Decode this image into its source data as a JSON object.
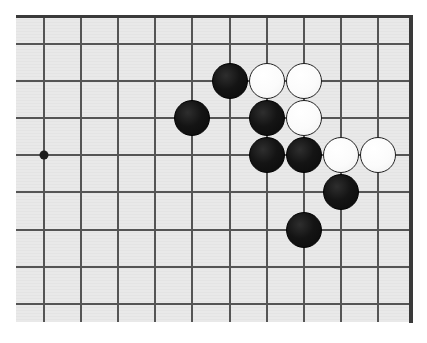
{
  "figure": {
    "kind": "go-board-diagram",
    "board_colors": {
      "surface": "#e9e9e9",
      "grid_line": "#555555",
      "border": "#3a3a3a",
      "black_stone": "#141414",
      "white_stone": "#fbfbfb",
      "white_stone_outline": "#222222",
      "hoshi": "#1c1c1c",
      "page_background": "#ffffff"
    }
  },
  "board": {
    "visible_columns": 10,
    "visible_rows": 8,
    "cell_size_px": 37.1,
    "origin_x_px": 44,
    "origin_y_px": 44,
    "stone_diameter_px": 36,
    "column_x_px": [
      44,
      81.1,
      118.2,
      155.3,
      192.4,
      229.5,
      266.6,
      303.7,
      340.8,
      377.9
    ],
    "row_y_px": [
      44,
      81.1,
      118.2,
      155.3,
      192.4,
      229.5,
      266.6,
      303.7
    ],
    "hoshi_points": [
      {
        "col": 0,
        "row": 3
      }
    ],
    "stones": [
      {
        "color": "black",
        "col": 5,
        "row": 1
      },
      {
        "color": "white",
        "col": 6,
        "row": 1
      },
      {
        "color": "white",
        "col": 7,
        "row": 1
      },
      {
        "color": "black",
        "col": 4,
        "row": 2
      },
      {
        "color": "black",
        "col": 6,
        "row": 2
      },
      {
        "color": "white",
        "col": 7,
        "row": 2
      },
      {
        "color": "black",
        "col": 6,
        "row": 3
      },
      {
        "color": "black",
        "col": 7,
        "row": 3
      },
      {
        "color": "white",
        "col": 8,
        "row": 3
      },
      {
        "color": "white",
        "col": 9,
        "row": 3
      },
      {
        "color": "black",
        "col": 8,
        "row": 4
      },
      {
        "color": "black",
        "col": 7,
        "row": 5
      }
    ],
    "stone_counts": {
      "black": 7,
      "white": 5,
      "total": 12
    }
  }
}
